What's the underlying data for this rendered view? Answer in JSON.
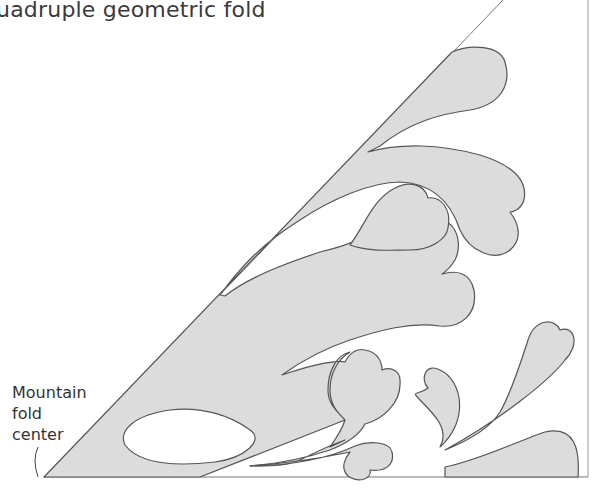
{
  "title_visible": "uadruple geometric fold",
  "annotation": {
    "lines": [
      "Mountain",
      "fold",
      "center"
    ]
  },
  "colors": {
    "fill": "#dcdcdc",
    "stroke": "#555555",
    "background": "#ffffff"
  }
}
